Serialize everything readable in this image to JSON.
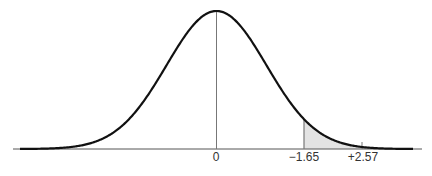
{
  "chart_data": {
    "type": "area",
    "title": "",
    "xlabel": "",
    "ylabel": "",
    "xlim": [
      -3.6,
      3.5
    ],
    "grid": false,
    "legend": null,
    "curve": "normal",
    "mean": 0,
    "sd": 1,
    "tick_labels": [
      "0",
      "−1.65",
      "+2.57"
    ],
    "markers": [
      {
        "label": "0",
        "position": 0,
        "style": "vertical line to peak"
      },
      {
        "label": "−1.65",
        "position": 1.65,
        "style": "vertical line to curve, shading start"
      },
      {
        "label": "+2.57",
        "position": 2.57,
        "style": "short tick"
      }
    ],
    "shaded_region": {
      "from": 1.65,
      "to": "tail",
      "color": "#e3e3e3"
    }
  },
  "labels": {
    "zero": "0",
    "first": "−1.65",
    "second": "+2.57"
  },
  "colors": {
    "curve": "#111111",
    "axis": "#555555",
    "shade": "#e3e3e3",
    "marker": "#777777"
  }
}
